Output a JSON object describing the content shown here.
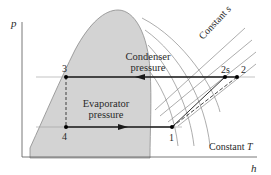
{
  "diagram": {
    "axes": {
      "y_label": "p",
      "x_label": "h"
    },
    "regions": {
      "condenser_label_line1": "Condenser",
      "condenser_label_line2": "pressure",
      "evaporator_label_line1": "Evaporator",
      "evaporator_label_line2": "pressure"
    },
    "states": [
      {
        "id": "1",
        "label": "1"
      },
      {
        "id": "2s",
        "label": "2s"
      },
      {
        "id": "2",
        "label": "2"
      },
      {
        "id": "3",
        "label": "3"
      },
      {
        "id": "4",
        "label": "4"
      }
    ],
    "annotations": {
      "constant_s": "Constant s",
      "constant_T": "Constant T"
    },
    "colors": {
      "dome_fill": "#d3d3d3",
      "dome_stroke": "#8a8a8a",
      "cycle_line": "#1a1a1a",
      "guide_line": "#9a9a9a"
    }
  }
}
